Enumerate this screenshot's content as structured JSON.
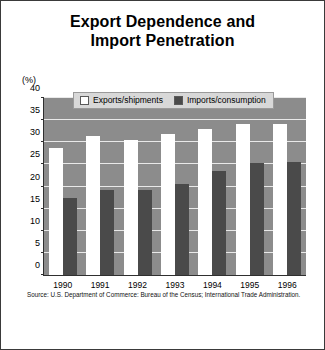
{
  "figure": {
    "title_line1": "Export Dependence and",
    "title_line2": "Import Penetration",
    "source": "Source: U.S. Department of Commerce: Bureau of the Census; International Trade Administration.",
    "unit_label": "(%)",
    "colors": {
      "plot_background": "#8c8c8c",
      "exports_bar": "#ffffff",
      "imports_bar": "#4a4a4a",
      "gridline": "#e9e9e9",
      "frame": "#3a3a3a",
      "legend_background": "#d8d8d8"
    }
  },
  "legend": {
    "position": "top-inside",
    "entries": [
      {
        "label": "Exports/shipments",
        "swatch": "white-square-icon"
      },
      {
        "label": "Imports/consumption",
        "swatch": "dark-square-icon"
      }
    ]
  },
  "chart_data": {
    "type": "bar",
    "title": "Export Dependence and Import Penetration",
    "xlabel": "",
    "ylabel": "(%)",
    "ylim": [
      0,
      40
    ],
    "yticks": [
      0,
      5,
      10,
      15,
      20,
      25,
      30,
      35,
      40
    ],
    "ytick_labels": [
      "0",
      "5",
      "10",
      "15",
      "20",
      "25",
      "30",
      "35",
      "40"
    ],
    "grid": true,
    "categories": [
      "1990",
      "1991",
      "1992",
      "1993",
      "1994",
      "1995",
      "1996"
    ],
    "series": [
      {
        "name": "Exports/shipments",
        "color": "#ffffff",
        "values": [
          28.8,
          31.4,
          30.4,
          31.9,
          33.0,
          34.1,
          34.2
        ]
      },
      {
        "name": "Imports/consumption",
        "color": "#4a4a4a",
        "values": [
          17.3,
          19.2,
          19.1,
          20.5,
          23.4,
          25.4,
          25.6
        ]
      }
    ],
    "source": "Source: U.S. Department of Commerce: Bureau of the Census; International Trade Administration."
  }
}
